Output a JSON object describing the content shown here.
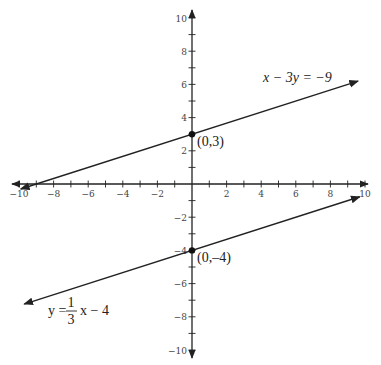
{
  "chart_data": {
    "type": "line",
    "title": "",
    "xlabel": "",
    "ylabel": "",
    "xlim": [
      -10,
      10
    ],
    "ylim": [
      -10,
      10
    ],
    "grid": false,
    "x_ticks": [
      -10,
      -8,
      -6,
      -4,
      -2,
      2,
      4,
      6,
      8,
      10
    ],
    "y_ticks": [
      10,
      8,
      6,
      4,
      2,
      -2,
      -4,
      -6,
      -8,
      -10
    ],
    "x_tick_labels": [
      "−10",
      "−8",
      "−6",
      "−4",
      "−2",
      "2",
      "4",
      "6",
      "8",
      "10"
    ],
    "y_tick_labels": [
      "10",
      "8",
      "6",
      "4",
      "2",
      "−2",
      "−4",
      "−6",
      "−8",
      "−10"
    ],
    "series": [
      {
        "name": "x − 3y = −9",
        "equation": "x - 3y = -9",
        "slope": 0.3333,
        "intercept": 3,
        "x": [
          -10,
          0,
          10
        ],
        "y": [
          -0.333,
          3,
          6.333
        ]
      },
      {
        "name": "y = (1/3)x − 4",
        "equation": "y = 1/3 x - 4",
        "slope": 0.3333,
        "intercept": -4,
        "x": [
          -10,
          0,
          10
        ],
        "y": [
          -7.333,
          -4,
          -0.667
        ]
      }
    ],
    "points": [
      {
        "label": "(0,3)",
        "x": 0,
        "y": 3
      },
      {
        "label": "(0,–4)",
        "x": 0,
        "y": -4
      }
    ],
    "annotations": {
      "line1_label": "x − 3y = −9",
      "line2_label_prefix": "y =",
      "line2_label_num": "1",
      "line2_label_den": "3",
      "line2_label_suffix": "x − 4",
      "point1_label": "(0,3)",
      "point2_label": "(0,–4)"
    }
  }
}
